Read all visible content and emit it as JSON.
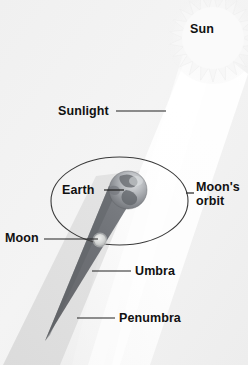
{
  "diagram": {
    "type": "astronomy-diagram",
    "width": 248,
    "height": 365,
    "background_color": "#f3f3f3"
  },
  "labels": {
    "sun": "Sun",
    "sunlight": "Sunlight",
    "earth": "Earth",
    "moon": "Moon",
    "umbra": "Umbra",
    "penumbra": "Penumbra",
    "moons_orbit": "Moon's orbit"
  },
  "colors": {
    "background": "#f3f3f3",
    "label_text": "#111111",
    "leader_line": "#222222",
    "orbit_line": "#3a3a3a",
    "sun_fill": "#f7f7f7",
    "sunbeam": "#ffffff",
    "penumbra_fill": "#dcdcdc",
    "umbra_fill": "#6a6d72",
    "earth_body": "#8f9296",
    "earth_lit": "#d8dadd",
    "moon_fill": "#d5d7d6"
  },
  "objects": {
    "sun": {
      "cx": 213,
      "cy": 38,
      "outer_r": 44,
      "inner_r": 30,
      "points": 22
    },
    "earth": {
      "cx": 128,
      "cy": 190,
      "r": 19
    },
    "moon": {
      "cx": 100,
      "cy": 240,
      "r": 6
    },
    "moon_orbit_ellipse": {
      "cx": 119.5,
      "cy": 201,
      "rx": 68.5,
      "ry": 44
    },
    "umbra_cone": {
      "apex_x": 45,
      "apex_y": 341,
      "base_cx": 128,
      "base_cy": 190
    }
  },
  "leaders": {
    "sunlight": {
      "x1": 116,
      "y1": 111,
      "x2": 166,
      "y2": 111
    },
    "earth": {
      "x1": 104,
      "y1": 190,
      "x2": 124,
      "y2": 190
    },
    "moon": {
      "x1": 44,
      "y1": 239,
      "x2": 98,
      "y2": 239
    },
    "umbra": {
      "x1": 92,
      "y1": 271,
      "x2": 131,
      "y2": 271
    },
    "penumbra": {
      "x1": 77,
      "y1": 318,
      "x2": 115,
      "y2": 318
    },
    "moons_orbit": {
      "x1": 186,
      "y1": 193,
      "x2": 194,
      "y2": 193
    }
  }
}
